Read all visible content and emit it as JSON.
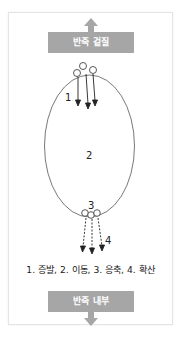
{
  "diagram": {
    "top_label": "반죽 겉질",
    "bottom_label": "반죽 내부",
    "step_numbers": [
      "1",
      "2",
      "3",
      "4"
    ],
    "legend": "1. 증발, 2. 이동, 3. 응축, 4. 확산",
    "colors": {
      "label_box": "#a6a6a6",
      "label_text": "#ffffff",
      "lines": "#333333",
      "card_border": "#e4e4e4"
    }
  }
}
